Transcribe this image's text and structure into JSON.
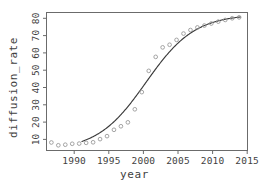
{
  "chart_data": {
    "type": "scatter",
    "title": "",
    "subtitle": "",
    "xlabel": "year",
    "ylabel": "diffusion_rate",
    "xlim": [
      1986.3,
      2015.2
    ],
    "ylim": [
      7.5,
      81.5
    ],
    "xticks": [
      1990,
      1995,
      2000,
      2005,
      2010,
      2015
    ],
    "yticks": [
      10,
      20,
      30,
      40,
      50,
      60,
      70,
      80
    ],
    "grid": false,
    "legend": null,
    "legend_position": "none",
    "point_color": "#9a9a9a",
    "line_color": "#3a3a3a",
    "axis_color": "#6b6b6b",
    "background_color": "#ffffff",
    "series": [
      {
        "name": "diffusion_rate",
        "kind": "scatter",
        "marker": "open-circle",
        "x": [
          1987,
          1988,
          1989,
          1990,
          1991,
          1992,
          1993,
          1994,
          1995,
          1996,
          1997,
          1998,
          1999,
          2000,
          2001,
          2002,
          2003,
          2004,
          2005,
          2006,
          2007,
          2008,
          2009,
          2010,
          2011,
          2012,
          2013,
          2014
        ],
        "y": [
          11.8,
          10.3,
          10.6,
          11.1,
          11.2,
          11.6,
          11.9,
          13.6,
          15.2,
          18.6,
          20.5,
          22.6,
          29.6,
          38.8,
          50.2,
          57.7,
          62.8,
          64.2,
          66.8,
          70.2,
          72.1,
          73.5,
          74.5,
          75.6,
          76.6,
          77.5,
          78.4,
          78.9
        ]
      },
      {
        "name": "logistic fit",
        "kind": "line",
        "asymptote": 80.6,
        "midpoint_year": 2000.6,
        "growth_rate": 0.285,
        "lower_asymptote": 7.4,
        "x_start": 1991.4,
        "x_end": 2014.2
      }
    ]
  },
  "axes": {
    "x_title": "year",
    "y_title": "diffusion_rate"
  }
}
